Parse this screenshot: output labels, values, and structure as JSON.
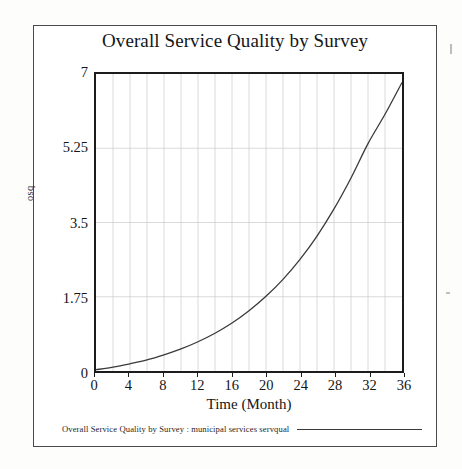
{
  "figure": {
    "title": "Overall Service Quality by Survey",
    "legend_label": "Overall Service Quality by Survey : municipal services servqual"
  },
  "chart_data": {
    "type": "line",
    "title": "Overall Service Quality by Survey",
    "xlabel": "Time (Month)",
    "ylabel": "osq",
    "xlim": [
      0,
      36
    ],
    "ylim": [
      0,
      7
    ],
    "grid": true,
    "legend_position": "below-plot",
    "x_ticks": [
      0,
      4,
      8,
      12,
      16,
      20,
      24,
      28,
      32,
      36
    ],
    "y_ticks": [
      0,
      1.75,
      3.5,
      5.25,
      7
    ],
    "x_minor_gridline_step": 2,
    "line_color": "#3a3a3a",
    "series": [
      {
        "name": "Overall Service Quality by Survey : municipal services servqual",
        "x": [
          0,
          2,
          4,
          6,
          8,
          10,
          12,
          14,
          16,
          18,
          20,
          22,
          24,
          26,
          28,
          30,
          32,
          34,
          36
        ],
        "values": [
          0.03,
          0.09,
          0.17,
          0.26,
          0.38,
          0.52,
          0.69,
          0.89,
          1.13,
          1.42,
          1.76,
          2.16,
          2.63,
          3.18,
          3.82,
          4.55,
          5.36,
          6.05,
          6.8
        ]
      }
    ]
  },
  "axis": {
    "y_tick_labels": [
      "7",
      "5.25",
      "3.5",
      "1.75",
      "0"
    ],
    "x_tick_labels": [
      "0",
      "4",
      "8",
      "12",
      "16",
      "20",
      "24",
      "28",
      "32",
      "36"
    ],
    "x_title": "Time (Month)",
    "y_title": "osq"
  }
}
